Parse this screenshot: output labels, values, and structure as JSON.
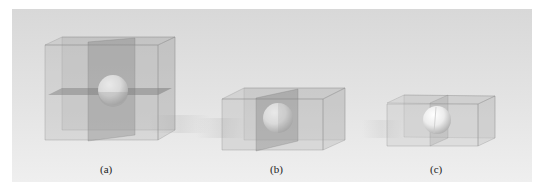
{
  "figure": {
    "background_top": "#d9d9d9",
    "background_bottom": "#efefef",
    "panels": [
      {
        "id": "a",
        "label": "(a)",
        "description": "Sphere inside a cube bisected by a vertical and a horizontal transparent plane"
      },
      {
        "id": "b",
        "label": "(b)",
        "description": "Sphere inside a flatter box bisected by one vertical transparent plane"
      },
      {
        "id": "c",
        "label": "(c)",
        "description": "Sphere in a flat box split by a vertical plane, partially protruding"
      }
    ],
    "colors": {
      "box_fill": "#9a9a9a",
      "box_edge": "#8a8a8a",
      "plane_fill": "#7e7e7e",
      "sphere_light": "#ffffff",
      "sphere_dark": "#b8b8b8"
    }
  }
}
